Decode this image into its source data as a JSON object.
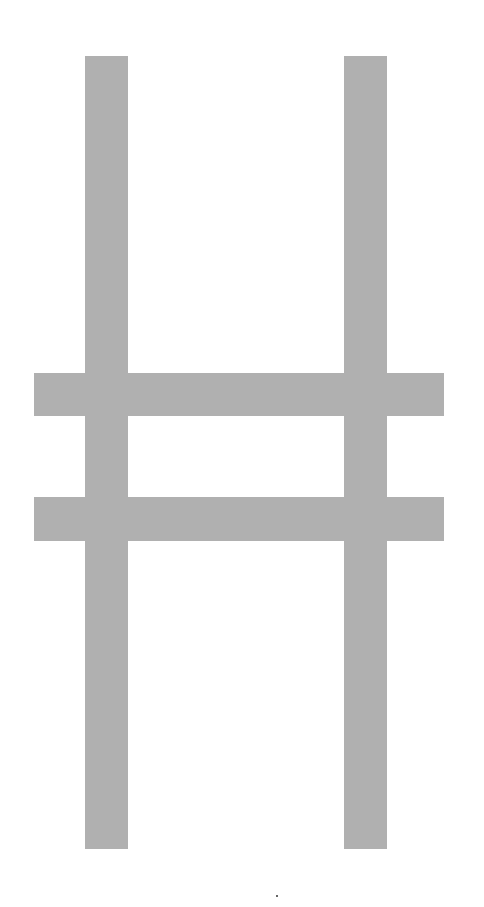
{
  "figure": {
    "bar_color": "#b0b0b0",
    "background_color": "#ffffff",
    "vertical_bars": [
      {
        "name": "left",
        "x": 85,
        "y": 56,
        "width": 43,
        "height": 793
      },
      {
        "name": "right",
        "x": 344,
        "y": 56,
        "width": 43,
        "height": 793
      }
    ],
    "horizontal_bars": [
      {
        "name": "upper",
        "x": 34,
        "y": 373,
        "width": 410,
        "height": 43
      },
      {
        "name": "lower",
        "x": 34,
        "y": 497,
        "width": 410,
        "height": 44
      }
    ],
    "artifact_dot": {
      "x": 276,
      "y": 895
    }
  }
}
